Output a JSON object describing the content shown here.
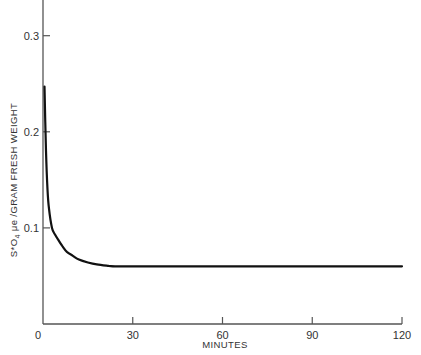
{
  "chart_data": {
    "type": "line",
    "title": "",
    "xlabel": "MINUTES",
    "ylabel": "S*O4 μe /GRAM FRESH WEIGHT",
    "ylabel_parts": {
      "s_star": "S*O",
      "subscript": "4",
      "rest": " μe /GRAM FRESH WEIGHT"
    },
    "xlim": [
      0,
      120
    ],
    "ylim": [
      0,
      0.35
    ],
    "x_ticks": [
      0,
      30,
      60,
      90,
      120
    ],
    "x_tick_labels": [
      "0",
      "30",
      "60",
      "90",
      "120"
    ],
    "y_ticks": [
      0.1,
      0.2,
      0.3
    ],
    "y_tick_labels": [
      "0.1",
      "0.2",
      "0.3"
    ],
    "grid": false,
    "legend": null,
    "series": [
      {
        "name": "S*O4 content",
        "color": "#111111",
        "x": [
          0.5,
          1,
          1.5,
          2,
          3,
          4,
          5,
          6.5,
          8,
          10,
          12,
          15,
          18,
          22,
          25,
          40,
          60,
          80,
          100,
          120
        ],
        "y": [
          0.247,
          0.18,
          0.14,
          0.12,
          0.1,
          0.093,
          0.088,
          0.081,
          0.075,
          0.071,
          0.067,
          0.064,
          0.062,
          0.0605,
          0.06,
          0.06,
          0.06,
          0.06,
          0.06,
          0.06
        ]
      }
    ]
  }
}
